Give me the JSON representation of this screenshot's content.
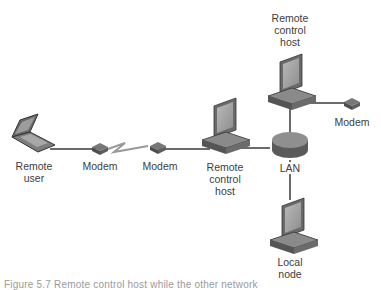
{
  "diagram": {
    "nodes": {
      "remote_user": {
        "label_line1": "Remote",
        "label_line2": "user"
      },
      "modem_left": {
        "label": "Modem"
      },
      "modem_right": {
        "label": "Modem"
      },
      "remote_host_center": {
        "label_line1": "Remote",
        "label_line2": "control",
        "label_line3": "host"
      },
      "remote_host_top": {
        "label_line1": "Remote",
        "label_line2": "control",
        "label_line3": "host"
      },
      "modem_top_right": {
        "label": "Modem"
      },
      "lan": {
        "label": "LAN"
      },
      "local_node": {
        "label_line1": "Local",
        "label_line2": "node"
      }
    },
    "edges": [
      {
        "from": "remote_user",
        "to": "modem_left",
        "type": "line"
      },
      {
        "from": "modem_left",
        "to": "modem_right",
        "type": "lightning"
      },
      {
        "from": "modem_right",
        "to": "remote_host_center",
        "type": "line"
      },
      {
        "from": "remote_host_center",
        "to": "lan",
        "type": "line"
      },
      {
        "from": "lan",
        "to": "remote_host_top",
        "type": "line"
      },
      {
        "from": "remote_host_top",
        "to": "modem_top_right",
        "type": "line"
      },
      {
        "from": "lan",
        "to": "local_node",
        "type": "line"
      }
    ],
    "caption": "Figure 5.7 Remote control host                while the other network"
  }
}
